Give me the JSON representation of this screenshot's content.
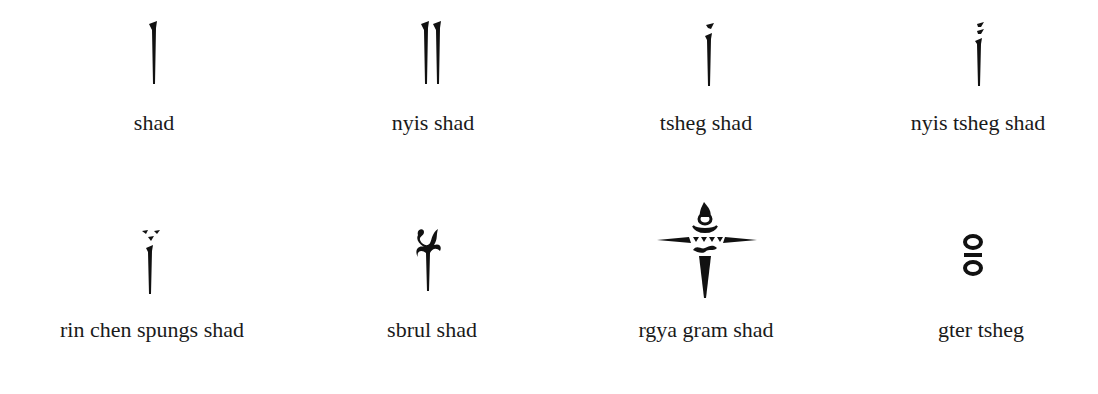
{
  "symbols": [
    {
      "name": "shad",
      "label": "shad"
    },
    {
      "name": "nyis-shad",
      "label": "nyis shad"
    },
    {
      "name": "tsheg-shad",
      "label": "tsheg shad"
    },
    {
      "name": "nyis-tsheg-shad",
      "label": "nyis tsheg shad"
    },
    {
      "name": "rin-chen-spungs-shad",
      "label": "rin chen spungs shad"
    },
    {
      "name": "sbrul-shad",
      "label": "sbrul shad"
    },
    {
      "name": "rgya-gram-shad",
      "label": "rgya gram shad"
    },
    {
      "name": "gter-tsheg",
      "label": "gter tsheg"
    }
  ],
  "colors": {
    "ink": "#111111",
    "background": "#ffffff"
  }
}
